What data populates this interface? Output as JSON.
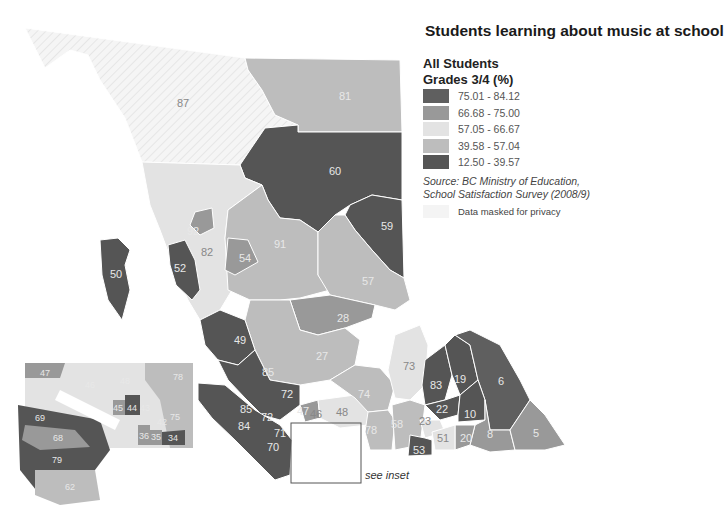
{
  "title": "Students learning about music at school",
  "legend": {
    "heading_line1": "All Students",
    "heading_line2": "Grades 3/4 (%)",
    "classes": [
      {
        "range": "75.01 - 84.12",
        "color": "#5f5f5f"
      },
      {
        "range": "66.68 - 75.00",
        "color": "#999999"
      },
      {
        "range": "57.05 - 66.67",
        "color": "#e3e3e3"
      },
      {
        "range": "39.58 - 57.04",
        "color": "#bdbdbd"
      },
      {
        "range": "12.50 - 39.57",
        "color": "#555555"
      }
    ],
    "source_line1": "Source: BC Ministry of Education,",
    "source_line2": "School Satisfaction Survey (2008/9)",
    "masked_label": "Data masked for privacy",
    "masked_color": "#f4f4f4"
  },
  "inset_caption": "see inset",
  "regions": {
    "r87": "87",
    "r81": "81",
    "r60": "60",
    "r59": "59",
    "r92": "92",
    "r82": "82",
    "r91": "91",
    "r54": "54",
    "r52": "52",
    "r50": "50",
    "r57": "57",
    "r28": "28",
    "r49": "49",
    "r27": "27",
    "r85a": "85",
    "r72a": "72",
    "r73": "73",
    "r74": "74",
    "r85b": "85",
    "r72b": "72",
    "r84": "84",
    "r71": "71",
    "r70": "70",
    "r47": "47",
    "r46": "46",
    "r48": "48",
    "r78": "78",
    "r58": "58",
    "r83": "83",
    "r19": "19",
    "r6": "6",
    "r22": "22",
    "r10": "10",
    "r23": "23",
    "r20": "20",
    "r8": "8",
    "r5": "5",
    "r51": "51",
    "r53": "53",
    "r67": "67"
  },
  "inset_regions": {
    "i47": "47",
    "i46": "46",
    "i48": "48",
    "i78": "78",
    "i44": "44",
    "i45": "45",
    "i43": "43",
    "i42": "42",
    "i75": "75",
    "i36": "36",
    "i35": "35",
    "i34": "34",
    "i69": "69",
    "i68": "68",
    "i79": "79",
    "i62": "62"
  }
}
